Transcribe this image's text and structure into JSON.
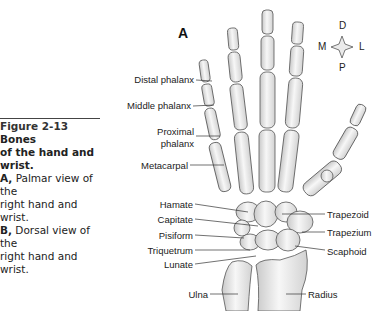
{
  "figure": {
    "number": "Figure 2-13",
    "title_bold": "Bones of the hand and wrist.",
    "title_bold_part1": "Bones",
    "title_bold_part2": "of the hand and wrist.",
    "caption_lines": [
      {
        "prefix": "A,",
        "text": " Palmar view of the"
      },
      {
        "prefix": "",
        "text": "right hand and wrist."
      },
      {
        "prefix": "B,",
        "text": " Dorsal view of the"
      },
      {
        "prefix": "",
        "text": "right hand and wrist."
      }
    ]
  },
  "panel_letter": "A",
  "compass": {
    "top": "D",
    "bottom": "P",
    "left": "M",
    "right": "L"
  },
  "labels_left": [
    {
      "text": "Distal phalanx"
    },
    {
      "text": "Middle phalanx"
    },
    {
      "text": "Proximal"
    },
    {
      "text": "phalanx"
    },
    {
      "text": "Metacarpal"
    },
    {
      "text": "Hamate"
    },
    {
      "text": "Capitate"
    },
    {
      "text": "Pisiform"
    },
    {
      "text": "Triquetrum"
    },
    {
      "text": "Lunate"
    },
    {
      "text": "Ulna"
    }
  ],
  "labels_right": [
    {
      "text": "Trapezoid"
    },
    {
      "text": "Trapezium"
    },
    {
      "text": "Scaphoid"
    },
    {
      "text": "Radius"
    }
  ]
}
